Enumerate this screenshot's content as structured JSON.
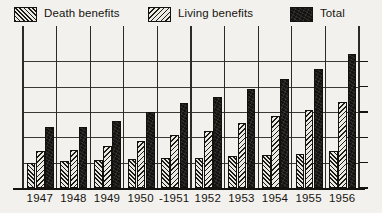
{
  "legend": {
    "items": [
      {
        "label": "Death benefits",
        "swatch": "diagonal-hatch-dense",
        "color": "#e9e8e3"
      },
      {
        "label": "Living benefits",
        "swatch": "diagonal-hatch-light",
        "color": "#ebeae5"
      },
      {
        "label": "Total",
        "swatch": "solid-black",
        "color": "#141210"
      }
    ]
  },
  "chart_data": {
    "type": "bar",
    "title": "",
    "subtitle": "",
    "xlabel": "",
    "ylabel": "",
    "grid": true,
    "legend_position": "top",
    "categories": [
      "1947",
      "1948",
      "1949",
      "1950",
      "-1951",
      "1952",
      "1953",
      "1954",
      "1955",
      "1956"
    ],
    "ylim": [
      0,
      6
    ],
    "yticks": [
      0,
      1,
      2,
      3,
      4,
      5
    ],
    "ytick_labels": [
      "",
      "",
      "",
      "",
      "",
      ""
    ],
    "series": [
      {
        "name": "Death benefits",
        "values": [
          1.0,
          1.05,
          1.1,
          1.15,
          1.2,
          1.2,
          1.25,
          1.3,
          1.35,
          1.45
        ]
      },
      {
        "name": "Living benefits",
        "values": [
          1.45,
          1.5,
          1.65,
          1.85,
          2.1,
          2.25,
          2.55,
          2.85,
          3.1,
          3.4
        ]
      },
      {
        "name": "Total",
        "values": [
          2.4,
          2.4,
          2.65,
          3.0,
          3.35,
          3.6,
          3.9,
          4.3,
          4.7,
          5.3
        ]
      }
    ]
  },
  "axes": {
    "vertical_gridline_count": 11,
    "horizontal_gridline_count": 5,
    "right_tick_count": 6
  }
}
